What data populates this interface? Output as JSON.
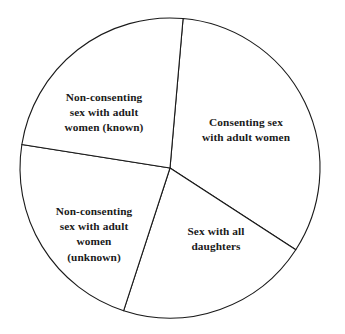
{
  "chart_data": {
    "type": "pie",
    "title": "",
    "subtitle": "",
    "xlabel": "",
    "ylabel": "",
    "legend_position": "none",
    "grid": false,
    "labels_inside_slices": true,
    "stroke_color": "#1a1a1a",
    "fill_color": "#ffffff",
    "center": {
      "x": 170,
      "y": 168
    },
    "radius": 150,
    "start_angle_deg": 5,
    "categories": [
      "Consenting sex with adult women",
      "Sex with all daughters",
      "Non-consenting sex with adult women (unknown)",
      "Non-consenting sex with adult women (known)"
    ],
    "values": [
      118,
      75,
      81,
      86
    ],
    "value_unit": "degrees",
    "slices": [
      {
        "name": "consenting-adult-women",
        "label": "Consenting sex\nwith adult women",
        "start_angle_deg": 5,
        "end_angle_deg": 123,
        "sweep_deg": 118,
        "percent": 32.8
      },
      {
        "name": "sex-all-daughters",
        "label": "Sex with all\ndaughters",
        "start_angle_deg": 123,
        "end_angle_deg": 198,
        "sweep_deg": 75,
        "percent": 20.8
      },
      {
        "name": "nonconsenting-unknown",
        "label": "Non-consenting\nsex with adult\nwomen\n(unknown)",
        "start_angle_deg": 198,
        "end_angle_deg": 279,
        "sweep_deg": 81,
        "percent": 22.5
      },
      {
        "name": "nonconsenting-known",
        "label": "Non-consenting\nsex with adult\nwomen (known)",
        "start_angle_deg": 279,
        "end_angle_deg": 365,
        "sweep_deg": 86,
        "percent": 23.9
      }
    ]
  }
}
